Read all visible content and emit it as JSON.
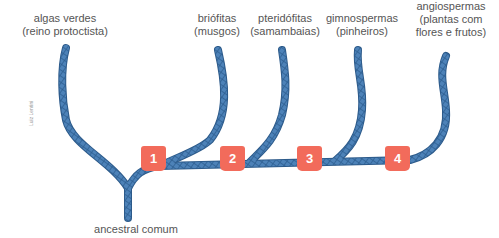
{
  "diagram": {
    "type": "cladogram",
    "branch_color": "#4a7fb5",
    "marker_color": "#f26b5b",
    "groups": [
      {
        "id": "algas",
        "line1": "algas verdes",
        "line2": "(reino protoctista)"
      },
      {
        "id": "briofitas",
        "line1": "briófitas",
        "line2": "(musgos)"
      },
      {
        "id": "pteridofitas",
        "line1": "pteridófitas",
        "line2": "(samambaias)"
      },
      {
        "id": "gimnospermas",
        "line1": "gimnospermas",
        "line2": "(pinheiros)"
      },
      {
        "id": "angiospermas",
        "line1": "angiospermas",
        "line2": "(plantas com",
        "line3": "flores e frutos)"
      }
    ],
    "markers": [
      "1",
      "2",
      "3",
      "4"
    ],
    "root_label": "ancestral comum",
    "credit": "Luiz Lentini"
  }
}
